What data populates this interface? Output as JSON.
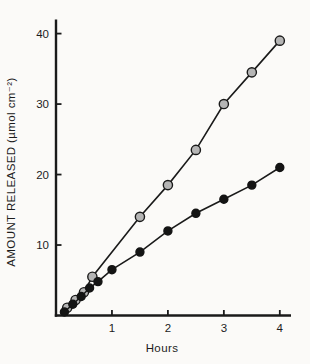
{
  "chart_data": {
    "type": "scatter-line",
    "title": "",
    "xlabel": "Hours",
    "ylabel": "AMOUNT RELEASED (µmol cm⁻²)",
    "xlim": [
      0,
      4.2
    ],
    "ylim": [
      0,
      42
    ],
    "xtick_values": [
      1,
      2,
      3,
      4
    ],
    "ytick_values": [
      10,
      20,
      30,
      40
    ],
    "grid": false,
    "legend": "none",
    "axis_color": "#1a1a1a",
    "background": "#fbfaf8",
    "tick_direction": "inward",
    "series": [
      {
        "name": "open-gray-circles",
        "marker": "circle-open-gray",
        "marker_fill": "#b5b5b5",
        "marker_stroke": "#1a1a1a",
        "marker_radius": 4.6,
        "line_color": "#1a1a1a",
        "points": [
          [
            0.2,
            1.1
          ],
          [
            0.35,
            2.2
          ],
          [
            0.5,
            3.3
          ],
          [
            0.65,
            5.5
          ],
          [
            1.5,
            14.0
          ],
          [
            2.0,
            18.5
          ],
          [
            2.5,
            23.5
          ],
          [
            3.0,
            30.0
          ],
          [
            3.5,
            34.5
          ],
          [
            4.0,
            39.0
          ]
        ]
      },
      {
        "name": "filled-black-circles",
        "marker": "circle-filled-black",
        "marker_fill": "#141414",
        "marker_stroke": "#141414",
        "marker_radius": 4.0,
        "line_color": "#1a1a1a",
        "points": [
          [
            0.15,
            0.5
          ],
          [
            0.3,
            1.6
          ],
          [
            0.45,
            2.7
          ],
          [
            0.6,
            3.9
          ],
          [
            0.75,
            4.8
          ],
          [
            1.0,
            6.5
          ],
          [
            1.5,
            9.0
          ],
          [
            2.0,
            12.0
          ],
          [
            2.5,
            14.5
          ],
          [
            3.0,
            16.5
          ],
          [
            3.5,
            18.5
          ],
          [
            4.0,
            21.0
          ]
        ]
      }
    ]
  }
}
